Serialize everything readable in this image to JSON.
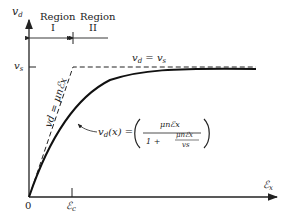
{
  "axes": {
    "y_label": "v",
    "y_label_sub": "d",
    "x_label": "ℰ",
    "x_label_sub": "x",
    "origin_label": "0",
    "vs_label": "v",
    "vs_label_sub": "s",
    "ec_label": "ℰ",
    "ec_label_sub": "c"
  },
  "regions": [
    {
      "name": "Region",
      "numeral": "I"
    },
    {
      "name": "Region",
      "numeral": "II"
    }
  ],
  "annotations": {
    "saturation": "v_d = v_s",
    "saturation_lhs": "v",
    "saturation_lhs_sub": "d",
    "saturation_eq": " = v",
    "saturation_rhs_sub": "s",
    "linear": "v_d = μ_n ℰ_x",
    "linear_text": "vd = μnℰx",
    "curve_lhs": "v",
    "curve_lhs_sub": "d",
    "curve_arg": "(x) =",
    "curve_num": "μnℰx",
    "curve_den_one": "1 +",
    "curve_den_num": "μnℰx",
    "curve_den_den": "vs"
  }
}
